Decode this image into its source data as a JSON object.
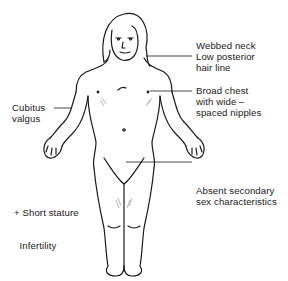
{
  "diagram": {
    "annotations": [
      {
        "id": "neck",
        "lines": [
          "Webbed neck",
          "Low posterior",
          "hair line"
        ],
        "side": "right"
      },
      {
        "id": "chest",
        "lines": [
          "Broad chest",
          "with wide –",
          "spaced nipples"
        ],
        "side": "right"
      },
      {
        "id": "cubitus",
        "lines": [
          "Cubitus",
          "valgus"
        ],
        "side": "left"
      },
      {
        "id": "sex",
        "lines": [
          "Absent secondary",
          "sex characteristics"
        ],
        "side": "right"
      },
      {
        "id": "stature",
        "lines": [
          "+ Short stature",
          "  Infertility"
        ],
        "side": "left"
      }
    ],
    "colors": {
      "ink": "#1a1a1a",
      "background": "#ffffff",
      "shade": "#9a9a9a"
    }
  }
}
